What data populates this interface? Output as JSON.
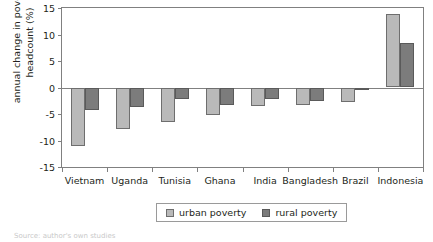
{
  "chart_data": {
    "type": "bar",
    "title": "",
    "xlabel": "",
    "ylabel": "annual change in poverty\nheadcount (%)",
    "ylim": [
      -15,
      15
    ],
    "yticks": [
      15,
      10,
      5,
      0,
      -5,
      -10,
      -15
    ],
    "ytick_labels": [
      "15",
      "10",
      "5",
      "0",
      "-5",
      "-10",
      "-15"
    ],
    "grid": false,
    "legend_position": "bottom-center",
    "categories": [
      "Vietnam",
      "Uganda",
      "Tunisia",
      "Ghana",
      "India",
      "Bangladesh",
      "Brazil",
      "Indonesia"
    ],
    "series": [
      {
        "name": "urban poverty",
        "color": "#b9b9b9",
        "values": [
          -11.1,
          -7.9,
          -6.5,
          -5.1,
          -3.5,
          -3.3,
          -2.8,
          13.9
        ]
      },
      {
        "name": "rural poverty",
        "color": "#7c7c7c",
        "values": [
          -4.2,
          -3.6,
          -2.1,
          -3.3,
          -2.2,
          -2.5,
          -0.5,
          8.4
        ]
      }
    ]
  },
  "legend": {
    "items": [
      {
        "label": "urban poverty",
        "swatch": "urban"
      },
      {
        "label": "rural poverty",
        "swatch": "rural"
      }
    ]
  },
  "source_note": "Source: author's own studies"
}
